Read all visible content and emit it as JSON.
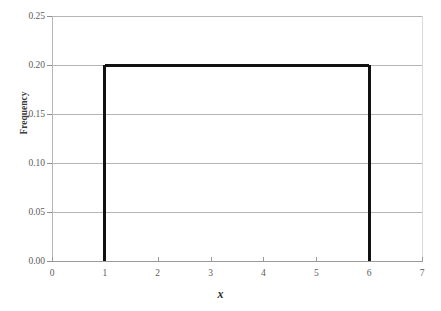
{
  "chart_data": {
    "type": "line",
    "title": "",
    "subtitle": "",
    "xlabel": "x",
    "ylabel": "Frequency",
    "xlim": [
      0,
      7
    ],
    "ylim": [
      0.0,
      0.25
    ],
    "grid": "horizontal",
    "legend": "none",
    "x_ticks": [
      "0",
      "1",
      "2",
      "3",
      "4",
      "5",
      "6",
      "7"
    ],
    "x_tick_values": [
      0,
      1,
      2,
      3,
      4,
      5,
      6,
      7
    ],
    "y_ticks": [
      "0.00",
      "0.05",
      "0.10",
      "0.15",
      "0.20",
      "0.25"
    ],
    "y_tick_values": [
      0.0,
      0.05,
      0.1,
      0.15,
      0.2,
      0.25
    ],
    "series": [
      {
        "name": "Uniform density",
        "color": "#111111",
        "x": [
          1,
          1,
          6,
          6
        ],
        "values": [
          0.0,
          0.2,
          0.2,
          0.0
        ]
      }
    ],
    "annotations": [],
    "plateau_value": 0.2,
    "support_start": 1,
    "support_end": 6
  },
  "style": {
    "background_color": "#ffffff",
    "gridline_color": "#b5b5b5",
    "axis_color": "#9a9a9a",
    "series_color": "#111111",
    "tick_label_color": "#5c5c5c",
    "axis_title_color": "#2e2e2e"
  }
}
